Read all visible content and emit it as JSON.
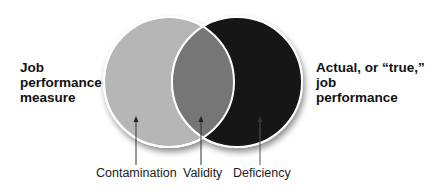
{
  "diagram": {
    "type": "venn",
    "left_circle": {
      "label_lines": [
        "Job",
        "performance",
        "measure"
      ],
      "color": "#b6b6b6"
    },
    "right_circle": {
      "label_lines": [
        "Actual, or “true,”",
        "job",
        "performance"
      ],
      "color": "#121212"
    },
    "overlap_color": "#767676",
    "regions": [
      {
        "name": "contamination",
        "label": "Contamination"
      },
      {
        "name": "validity",
        "label": "Validity"
      },
      {
        "name": "deficiency",
        "label": "Deficiency"
      }
    ]
  }
}
